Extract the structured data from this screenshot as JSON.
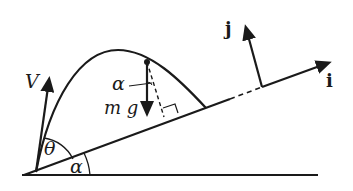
{
  "diagram": {
    "labels": {
      "velocity": "V",
      "launch_angle": "θ",
      "incline_angle_base": "α",
      "incline_angle_gravity": "α",
      "gravity_force": "m g",
      "unit_i": "i",
      "unit_j": "j"
    },
    "elements": [
      "ground line",
      "inclined plane",
      "trajectory",
      "velocity vector",
      "gravity vector",
      "perpendicular dashed line",
      "right-angle marker",
      "unit vectors i and j"
    ]
  }
}
